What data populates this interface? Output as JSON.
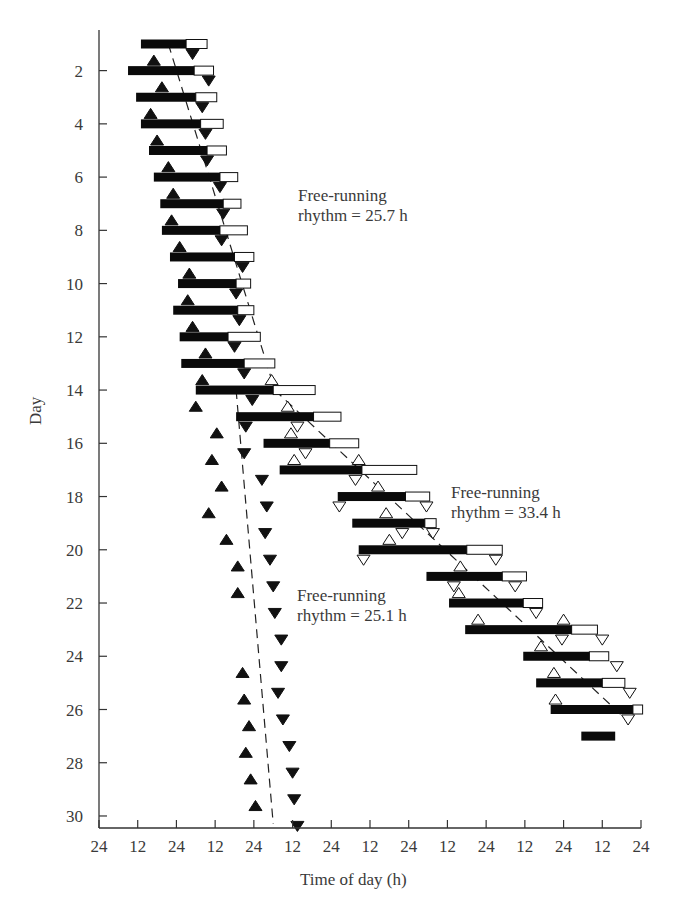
{
  "chart_data": {
    "type": "actogram",
    "title": "",
    "xlabel": "Time of day (h)",
    "ylabel": "Day",
    "x_tick_labels": [
      "24",
      "12",
      "24",
      "12",
      "24",
      "12",
      "24",
      "12",
      "24",
      "12",
      "24",
      "12",
      "24",
      "12",
      "24"
    ],
    "y_tick_labels": [
      "2",
      "4",
      "6",
      "8",
      "10",
      "12",
      "14",
      "16",
      "18",
      "20",
      "22",
      "24",
      "26",
      "28",
      "30"
    ],
    "y_ticks": [
      2,
      4,
      6,
      8,
      10,
      12,
      14,
      16,
      18,
      20,
      22,
      24,
      26,
      28,
      30
    ],
    "xlim_hours": [
      0,
      168
    ],
    "ylim_days": [
      1,
      30
    ],
    "annotations": [
      {
        "line1": "Free-running",
        "line2": "rhythm = 25.7 h",
        "x": 298,
        "y": 186
      },
      {
        "line1": "Free-running",
        "line2": "rhythm = 33.4 h",
        "x": 451,
        "y": 483
      },
      {
        "line1": "Free-running",
        "line2": "rhythm = 25.1 h",
        "x": 297,
        "y": 586
      }
    ],
    "activity_bars": [
      {
        "day": 1,
        "start": 13.0,
        "black_end": 27.0,
        "end": 33.5
      },
      {
        "day": 2,
        "start": 9.0,
        "black_end": 29.5,
        "end": 35.5
      },
      {
        "day": 3,
        "start": 11.5,
        "black_end": 30.0,
        "end": 36.5
      },
      {
        "day": 4,
        "start": 13.0,
        "black_end": 31.5,
        "end": 38.5
      },
      {
        "day": 5,
        "start": 15.5,
        "black_end": 33.5,
        "end": 39.5
      },
      {
        "day": 6,
        "start": 17.0,
        "black_end": 37.5,
        "end": 43.0
      },
      {
        "day": 7,
        "start": 19.0,
        "black_end": 38.5,
        "end": 44.0
      },
      {
        "day": 8,
        "start": 19.5,
        "black_end": 37.5,
        "end": 46.0
      },
      {
        "day": 9,
        "start": 22.0,
        "black_end": 42.0,
        "end": 48.0
      },
      {
        "day": 10,
        "start": 24.5,
        "black_end": 42.5,
        "end": 47.0
      },
      {
        "day": 11,
        "start": 23.0,
        "black_end": 43.0,
        "end": 48.0
      },
      {
        "day": 12,
        "start": 25.0,
        "black_end": 40.0,
        "end": 50.0
      },
      {
        "day": 13,
        "start": 25.5,
        "black_end": 45.0,
        "end": 54.5
      },
      {
        "day": 14,
        "start": 30.0,
        "black_end": 54.0,
        "end": 67.0
      },
      {
        "day": 15,
        "start": 42.5,
        "black_end": 66.5,
        "end": 75.0
      },
      {
        "day": 16,
        "start": 51.0,
        "black_end": 71.5,
        "end": 80.5
      },
      {
        "day": 17,
        "start": 56.0,
        "black_end": 81.5,
        "end": 98.5
      },
      {
        "day": 18,
        "start": 74.0,
        "black_end": 95.0,
        "end": 102.5
      },
      {
        "day": 19,
        "start": 78.5,
        "black_end": 101.0,
        "end": 104.5
      },
      {
        "day": 20,
        "start": 80.5,
        "black_end": 114.0,
        "end": 125.0
      },
      {
        "day": 21,
        "start": 101.5,
        "black_end": 125.0,
        "end": 132.5
      },
      {
        "day": 22,
        "start": 108.5,
        "black_end": 131.5,
        "end": 137.5
      },
      {
        "day": 23,
        "start": 113.5,
        "black_end": 146.5,
        "end": 154.5
      },
      {
        "day": 24,
        "start": 131.5,
        "black_end": 152.0,
        "end": 158.0
      },
      {
        "day": 25,
        "start": 135.5,
        "black_end": 156.0,
        "end": 163.0
      },
      {
        "day": 26,
        "start": 140.0,
        "black_end": 165.5,
        "end": 168.5
      },
      {
        "day": 27,
        "start": 149.5,
        "black_end": 160.0,
        "end": 160.0
      }
    ],
    "onset_markers_filled": [
      {
        "day": 2,
        "h": 17.0
      },
      {
        "day": 3,
        "h": 19.5
      },
      {
        "day": 4,
        "h": 16.0
      },
      {
        "day": 5,
        "h": 18.0
      },
      {
        "day": 6,
        "h": 21.5
      },
      {
        "day": 7,
        "h": 23.0
      },
      {
        "day": 8,
        "h": 22.5
      },
      {
        "day": 9,
        "h": 25.0
      },
      {
        "day": 10,
        "h": 28.0
      },
      {
        "day": 11,
        "h": 27.5
      },
      {
        "day": 12,
        "h": 29.0
      },
      {
        "day": 13,
        "h": 33.0
      },
      {
        "day": 14,
        "h": 32.0
      },
      {
        "day": 15,
        "h": 30.0
      },
      {
        "day": 16,
        "h": 36.5
      },
      {
        "day": 17,
        "h": 35.0
      },
      {
        "day": 18,
        "h": 38.0
      },
      {
        "day": 19,
        "h": 34.0
      },
      {
        "day": 20,
        "h": 39.5
      },
      {
        "day": 21,
        "h": 43.0
      },
      {
        "day": 22,
        "h": 43.0
      },
      {
        "day": 25,
        "h": 44.5
      },
      {
        "day": 26,
        "h": 45.0
      },
      {
        "day": 27,
        "h": 46.5
      },
      {
        "day": 28,
        "h": 45.5
      },
      {
        "day": 29,
        "h": 47.0
      },
      {
        "day": 30,
        "h": 48.5
      }
    ],
    "offset_markers_filled": [
      {
        "day": 1,
        "h": 29.0
      },
      {
        "day": 2,
        "h": 34.0
      },
      {
        "day": 3,
        "h": 32.0
      },
      {
        "day": 4,
        "h": 33.0
      },
      {
        "day": 5,
        "h": 33.5
      },
      {
        "day": 6,
        "h": 37.5
      },
      {
        "day": 7,
        "h": 38.5
      },
      {
        "day": 8,
        "h": 38.0
      },
      {
        "day": 9,
        "h": 44.5
      },
      {
        "day": 10,
        "h": 42.5
      },
      {
        "day": 11,
        "h": 43.5
      },
      {
        "day": 12,
        "h": 42.0
      },
      {
        "day": 13,
        "h": 45.0
      },
      {
        "day": 14,
        "h": 47.5
      },
      {
        "day": 15,
        "h": 45.5
      },
      {
        "day": 16,
        "h": 45.0
      },
      {
        "day": 17,
        "h": 50.5
      },
      {
        "day": 18,
        "h": 52.0
      },
      {
        "day": 19,
        "h": 51.5
      },
      {
        "day": 20,
        "h": 53.0
      },
      {
        "day": 21,
        "h": 54.0
      },
      {
        "day": 22,
        "h": 54.5
      },
      {
        "day": 23,
        "h": 56.5
      },
      {
        "day": 24,
        "h": 56.5
      },
      {
        "day": 25,
        "h": 55.5
      },
      {
        "day": 26,
        "h": 57.0
      },
      {
        "day": 27,
        "h": 59.0
      },
      {
        "day": 28,
        "h": 60.0
      },
      {
        "day": 29,
        "h": 60.5
      },
      {
        "day": 30,
        "h": 61.5
      }
    ],
    "onset_markers_open": [
      {
        "day": 14,
        "h": 53.5
      },
      {
        "day": 15,
        "h": 58.5
      },
      {
        "day": 16,
        "h": 59.5
      },
      {
        "day": 17,
        "h": 60.5
      },
      {
        "day": 17,
        "h": 80.5
      },
      {
        "day": 18,
        "h": 86.5
      },
      {
        "day": 19,
        "h": 89.0
      },
      {
        "day": 20,
        "h": 90.0
      },
      {
        "day": 21,
        "h": 112.0
      },
      {
        "day": 22,
        "h": 111.5
      },
      {
        "day": 23,
        "h": 117.5
      },
      {
        "day": 23,
        "h": 144.0
      },
      {
        "day": 24,
        "h": 137.0
      },
      {
        "day": 25,
        "h": 141.0
      },
      {
        "day": 26,
        "h": 141.5
      }
    ],
    "offset_markers_open": [
      {
        "day": 15,
        "h": 61.5
      },
      {
        "day": 16,
        "h": 64.0
      },
      {
        "day": 17,
        "h": 79.5
      },
      {
        "day": 18,
        "h": 74.5
      },
      {
        "day": 18,
        "h": 101.5
      },
      {
        "day": 19,
        "h": 94.0
      },
      {
        "day": 19,
        "h": 103.5
      },
      {
        "day": 20,
        "h": 82.0
      },
      {
        "day": 20,
        "h": 123.0
      },
      {
        "day": 21,
        "h": 110.0
      },
      {
        "day": 21,
        "h": 129.0
      },
      {
        "day": 22,
        "h": 135.5
      },
      {
        "day": 23,
        "h": 143.5
      },
      {
        "day": 23,
        "h": 156.0
      },
      {
        "day": 24,
        "h": 160.5
      },
      {
        "day": 25,
        "h": 164.5
      },
      {
        "day": 26,
        "h": 164.0
      }
    ],
    "fit_lines": [
      {
        "name": "Free-running rhythm = 25.7 h",
        "points": [
          [
            21.5,
            1
          ],
          [
            54.5,
            14
          ]
        ]
      },
      {
        "name": "Free-running rhythm = 33.4 h",
        "points": [
          [
            54.5,
            14
          ],
          [
            164.5,
            26.5
          ]
        ]
      },
      {
        "name": "Free-running rhythm = 25.1 h",
        "points": [
          [
            42.5,
            14
          ],
          [
            54.0,
            30.3
          ]
        ]
      }
    ],
    "legend": []
  }
}
